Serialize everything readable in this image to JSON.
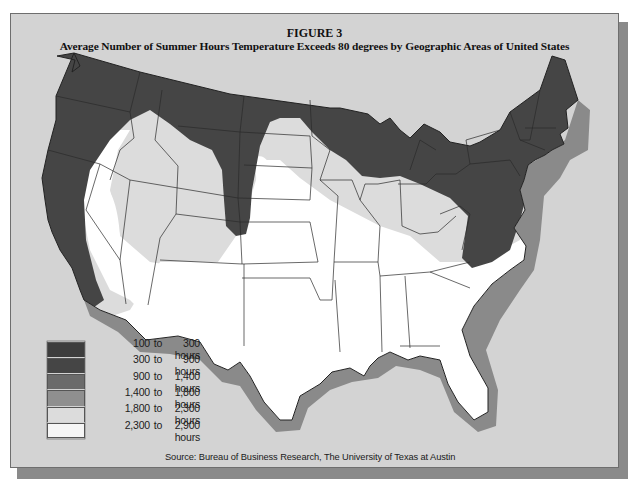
{
  "figure": {
    "number": "FIGURE 3",
    "title": "Average Number of Summer Hours Temperature Exceeds 80 degrees by Geographic Areas of United States"
  },
  "legend": {
    "items": [
      {
        "from": "100",
        "to_word": "to",
        "upto": "300",
        "unit": "hours",
        "color": "#3d3d3d"
      },
      {
        "from": "300",
        "to_word": "to",
        "upto": "900",
        "unit": "hours",
        "color": "#454545"
      },
      {
        "from": "900",
        "to_word": "to",
        "upto": "1,400",
        "unit": "hours",
        "color": "#6b6b6b"
      },
      {
        "from": "1,400",
        "to_word": "to",
        "upto": "1,800",
        "unit": "hours",
        "color": "#8f8f8f"
      },
      {
        "from": "1,800",
        "to_word": "to",
        "upto": "2,300",
        "unit": "hours",
        "color": "#dcdcdc"
      },
      {
        "from": "2,300",
        "to_word": "to",
        "upto": "2,900",
        "unit": "hours",
        "color": "#f6f6f6"
      }
    ]
  },
  "map": {
    "region": "Contiguous United States",
    "colors": {
      "background": "#d3d3d3",
      "dark_zone": "#454545",
      "light_zone": "#dcdcdc",
      "white_zone": "#ffffff",
      "coast_shadow": "#8a8a8a",
      "border": "#222222"
    },
    "zones": [
      {
        "name": "Northern tier and Pacific coast",
        "range": "100 to 900 hours"
      },
      {
        "name": "Transitional band",
        "range": "1,800 to 2,300 hours"
      },
      {
        "name": "South, Southwest and interior valleys",
        "range": "2,300 to 2,900 hours"
      }
    ]
  },
  "source": "Source: Bureau of Business Research, The University of Texas at Austin"
}
